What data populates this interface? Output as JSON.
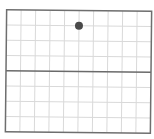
{
  "diagram": {
    "type": "grid-with-point",
    "grid": {
      "columns": 10,
      "rows": 8,
      "frame": {
        "x": 6,
        "y": 10.5,
        "width": 145,
        "height": 122
      },
      "gridline_color": "#d9d9d9",
      "frame_color": "#6e6e6e",
      "axis_color": "#6a6a6a",
      "axis_row_index": 4,
      "rotation_deg": 0.6
    },
    "points": [
      {
        "label": "",
        "col": 5,
        "row": 1,
        "color": "#4a4a4a",
        "radius": 4
      }
    ]
  },
  "chart_data": {
    "type": "scatter",
    "title": "",
    "xlabel": "",
    "ylabel": "",
    "x": [
      5
    ],
    "y": [
      3
    ],
    "xlim": [
      0,
      10
    ],
    "ylim": [
      -4,
      4
    ],
    "grid": true
  }
}
